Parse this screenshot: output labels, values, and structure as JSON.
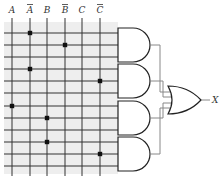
{
  "inputs": [
    {
      "label": "A",
      "bar": false,
      "x": 12
    },
    {
      "label": "A",
      "bar": true,
      "x": 30
    },
    {
      "label": "B",
      "bar": false,
      "x": 47
    },
    {
      "label": "B",
      "bar": true,
      "x": 65
    },
    {
      "label": "C",
      "bar": false,
      "x": 82
    },
    {
      "label": "C",
      "bar": true,
      "x": 100
    }
  ],
  "rows_y": [
    33,
    45,
    57,
    69,
    81,
    93,
    106,
    118,
    130,
    142,
    154,
    166
  ],
  "connections": [
    {
      "row": 0,
      "input": 1
    },
    {
      "row": 1,
      "input": 3
    },
    {
      "row": 3,
      "input": 1
    },
    {
      "row": 4,
      "input": 5
    },
    {
      "row": 6,
      "input": 0
    },
    {
      "row": 7,
      "input": 2
    },
    {
      "row": 9,
      "input": 2
    },
    {
      "row": 10,
      "input": 5
    }
  ],
  "and_gates": 4,
  "or_gates": 1,
  "output_label": "X",
  "colors": {
    "grid_bg": "#eeeeee",
    "line": "#333333",
    "fuse": "#111111",
    "wire": "#888888"
  }
}
